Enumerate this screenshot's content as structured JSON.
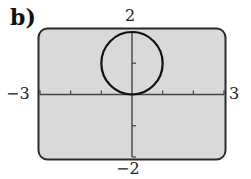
{
  "part_label": "b)",
  "axis_labels": {
    "ymax": "2",
    "ymin": "−2",
    "xmin": "−3",
    "xmax": "3"
  },
  "colors": {
    "screen_fill": "#d9d9d9",
    "screen_border": "#2a2a2a",
    "axis": "#444444",
    "curve": "#111111"
  },
  "chart_data": {
    "type": "line",
    "title": "b)",
    "xlabel": "",
    "ylabel": "",
    "xlim": [
      -3,
      3
    ],
    "ylim": [
      -2,
      2
    ],
    "x_ticks": [
      -3,
      -2,
      -1,
      0,
      1,
      2,
      3
    ],
    "y_ticks": [
      -2,
      -1,
      0,
      1,
      2
    ],
    "tick_labels": {
      "x": [
        "−3",
        "3"
      ],
      "y": [
        "−2",
        "2"
      ]
    },
    "grid": false,
    "legend": null,
    "series": [
      {
        "name": "circle",
        "shape": "circle",
        "center": [
          0,
          1
        ],
        "radius": 1,
        "equation": "x^2 + (y-1)^2 = 1"
      }
    ]
  }
}
